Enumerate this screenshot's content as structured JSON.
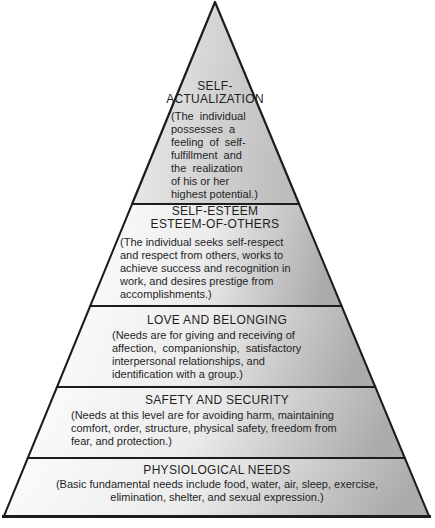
{
  "diagram": {
    "kind": "needs-hierarchy-pyramid",
    "level_count": 5
  },
  "levels": [
    {
      "title": "SELF-\nACTUALIZATION",
      "description": "(The  individual\npossesses  a\nfeeling  of  self-\nfulfillment  and\nthe  realization\nof his or her\nhighest potential.)"
    },
    {
      "title": "SELF-ESTEEM\nESTEEM-OF-OTHERS",
      "description": "(The individual seeks self-respect\nand respect from others, works to\nachieve success and recognition in\nwork, and desires prestige from\naccomplishments.)"
    },
    {
      "title": "LOVE AND BELONGING",
      "description": "(Needs are for giving and receiving of\naffection,  companionship,  satisfactory\ninterpersonal relationships, and\nidentification with a group.)"
    },
    {
      "title": "SAFETY AND SECURITY",
      "description": "(Needs at this level are for avoiding harm, maintaining\ncomfort, order, structure, physical safety, freedom from\nfear, and protection.)"
    },
    {
      "title": "PHYSIOLOGICAL NEEDS",
      "description": "(Basic fundamental needs include food, water, air, sleep, exercise,\nelimination, shelter, and sexual expression.)"
    }
  ],
  "colors": {
    "outline": "#1c1c1c",
    "apex_light": "#ececec",
    "apex_dark": "#bdbdbd",
    "band_light": "#fcfcfc",
    "band_mid": "#ececec",
    "band_dark": "#ababab",
    "text": "#1f1f1f",
    "background": "#ffffff"
  }
}
